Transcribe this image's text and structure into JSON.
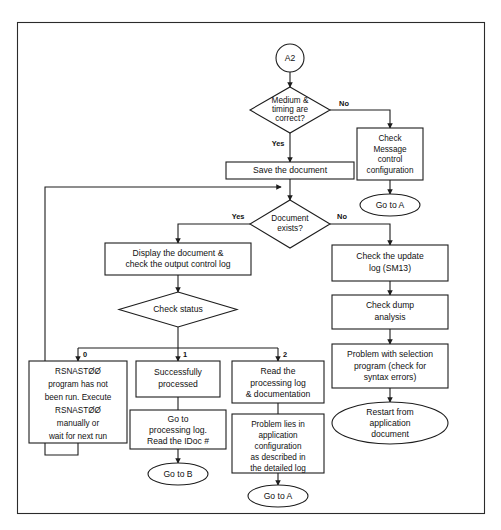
{
  "diagram": {
    "background_color": "#ffffff",
    "line_color": "#1d1d1d",
    "frame_color": "#2b2b2b",
    "nodes": {
      "start_connector": {
        "label": "A2",
        "shape": "circle"
      },
      "decision_medium_timing": {
        "line1": "Medium &",
        "line2": "timing are",
        "line3": "correct?",
        "shape": "diamond"
      },
      "check_message_control": {
        "line1": "Check",
        "line2": "Message",
        "line3": "control",
        "line4": "configuration",
        "shape": "box"
      },
      "goto_a_right": {
        "label": "Go to A",
        "shape": "ellipse"
      },
      "save_document": {
        "line1": "Save the document",
        "shape": "box"
      },
      "decision_document_exists": {
        "line1": "Document",
        "line2": "exists?",
        "shape": "diamond"
      },
      "display_document": {
        "line1": "Display the document &",
        "line2": "check the output control log",
        "shape": "box"
      },
      "decision_check_status": {
        "line1": "Check status",
        "shape": "diamond"
      },
      "rsnast_not_run": {
        "line1": "RSNASTØØ",
        "line2": "program has not",
        "line3": "been run. Execute",
        "line4": "RSNASTØØ",
        "line5": "manually or",
        "line6": "wait for next run",
        "shape": "box"
      },
      "successfully_processed": {
        "line1": "Successfully",
        "line2": "processed",
        "shape": "box"
      },
      "goto_processing_log": {
        "line1": "Go to",
        "line2": "processing log.",
        "line3": "Read the IDoc #",
        "shape": "box"
      },
      "goto_b": {
        "label": "Go to B",
        "shape": "ellipse"
      },
      "read_processing_log": {
        "line1": "Read the",
        "line2": "processing log",
        "line3": "& documentation",
        "shape": "box"
      },
      "problem_lies_in_app": {
        "line1": "Problem lies in",
        "line2": "application",
        "line3": "configuration",
        "line4": "as described in",
        "line5": "the detailed log",
        "shape": "box"
      },
      "goto_a_bottom": {
        "label": "Go to A",
        "shape": "ellipse"
      },
      "check_update_log": {
        "line1": "Check the update",
        "line2": "log (SM13)",
        "shape": "box"
      },
      "check_dump_analysis": {
        "line1": "Check dump",
        "line2": "analysis",
        "shape": "box"
      },
      "problem_with_selection": {
        "line1": "Problem with selection",
        "line2": "program (check for",
        "line3": "syntax errors)",
        "shape": "box"
      },
      "restart_from_application": {
        "line1": "Restart from",
        "line2": "application",
        "line3": "document",
        "shape": "ellipse"
      }
    },
    "edge_labels": {
      "medium_no": "No",
      "medium_yes": "Yes",
      "document_yes": "Yes",
      "document_no": "No",
      "status_0": "0",
      "status_1": "1",
      "status_2": "2"
    }
  }
}
